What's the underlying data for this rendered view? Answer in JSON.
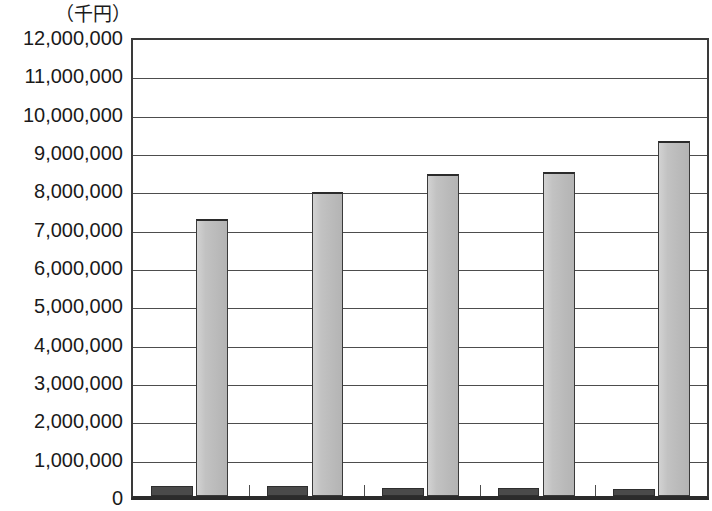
{
  "chart": {
    "unit_caption": "（千円）",
    "zero_label": "0"
  },
  "chart_data": {
    "type": "bar",
    "title": "",
    "subtitle": "",
    "xlabel": "",
    "ylabel": "（千円）",
    "unit": "千円",
    "grid": true,
    "legend": "none",
    "ylim": [
      0,
      12000000
    ],
    "ytick_step": 1000000,
    "yticks": [
      "0",
      "1,000,000",
      "2,000,000",
      "3,000,000",
      "4,000,000",
      "5,000,000",
      "6,000,000",
      "7,000,000",
      "8,000,000",
      "9,000,000",
      "10,000,000",
      "11,000,000",
      "12,000,000"
    ],
    "ytick_values": [
      0,
      1000000,
      2000000,
      3000000,
      4000000,
      5000000,
      6000000,
      7000000,
      8000000,
      9000000,
      10000000,
      11000000,
      12000000
    ],
    "categories": [
      "",
      "",
      "",
      "",
      ""
    ],
    "series": [
      {
        "name": "dark-series",
        "color": "#4a4a4a",
        "values": [
          250000,
          250000,
          200000,
          200000,
          180000
        ]
      },
      {
        "name": "light-series",
        "color": "#bfbfbf",
        "values": [
          7230000,
          7930000,
          8400000,
          8450000,
          9250000
        ]
      }
    ]
  }
}
